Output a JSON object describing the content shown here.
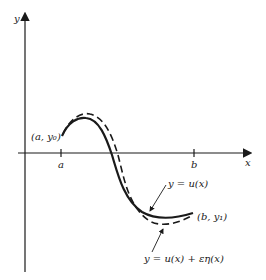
{
  "diagram": {
    "axes": {
      "y_label": "y",
      "x_label": "x"
    },
    "ticks": {
      "a": "a",
      "b": "b"
    },
    "endpoints": {
      "start": "(a, y₀)",
      "end": "(b, y₁)"
    },
    "curves": {
      "solid": "y = u(x)",
      "dashed": "y = u(x) + εη(x)"
    },
    "colors": {
      "ink": "#1a1a1a",
      "background": "#ffffff"
    }
  }
}
